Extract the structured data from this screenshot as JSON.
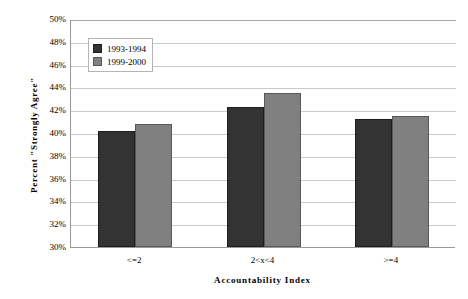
{
  "chart_data": {
    "type": "bar",
    "title": "",
    "xlabel": "Accountability Index",
    "ylabel": "Percent \"Strongly Agree\"",
    "categories": [
      "<=2",
      "2<x<4",
      ">=4"
    ],
    "series": [
      {
        "name": "1993-1994",
        "color": "#333333",
        "values": [
          40.2,
          42.3,
          41.2
        ]
      },
      {
        "name": "1999-2000",
        "color": "#808080",
        "values": [
          40.8,
          43.5,
          41.5
        ]
      }
    ],
    "ylim": [
      30,
      50
    ],
    "ytick_step": 2,
    "ytick_labels": [
      "50%",
      "48%",
      "46%",
      "44%",
      "42%",
      "40%",
      "38%",
      "36%",
      "34%",
      "32%",
      "30%"
    ],
    "ytick_values": [
      50,
      48,
      46,
      44,
      42,
      40,
      38,
      36,
      34,
      32,
      30
    ],
    "grid": true,
    "legend_position": "top-left"
  },
  "legend": {
    "entries": [
      {
        "label": "1993-1994"
      },
      {
        "label": "1999-2000"
      }
    ]
  }
}
